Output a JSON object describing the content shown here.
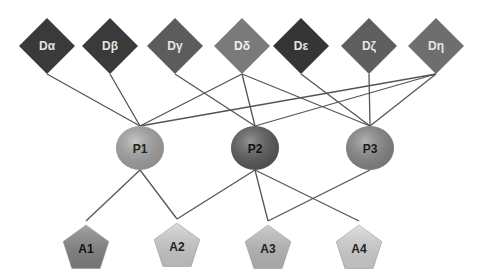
{
  "diagram": {
    "edge_color": "#555555",
    "d_nodes": [
      {
        "id": "Da",
        "label": "Dα",
        "x": 47,
        "y": 46,
        "fill": "#3a3a3a",
        "text": "#e6e6e6"
      },
      {
        "id": "Db",
        "label": "Dβ",
        "x": 110,
        "y": 46,
        "fill": "#3a3a3a",
        "text": "#e6e6e6"
      },
      {
        "id": "Dg",
        "label": "Dγ",
        "x": 175,
        "y": 46,
        "fill": "#5c5c5c",
        "text": "#e6e6e6"
      },
      {
        "id": "Dd",
        "label": "Dδ",
        "x": 242,
        "y": 46,
        "fill": "#7a7a7a",
        "text": "#f0f0f0"
      },
      {
        "id": "De",
        "label": "Dε",
        "x": 301,
        "y": 46,
        "fill": "#353535",
        "text": "#e6e6e6"
      },
      {
        "id": "Dz",
        "label": "Dζ",
        "x": 369,
        "y": 46,
        "fill": "#5e5e5e",
        "text": "#e6e6e6"
      },
      {
        "id": "Dh",
        "label": "Dη",
        "x": 436,
        "y": 46,
        "fill": "#6e6e6e",
        "text": "#e6e6e6"
      }
    ],
    "p_nodes": [
      {
        "id": "P1",
        "label": "P1",
        "x": 140,
        "y": 148,
        "fill": "#a8a8a8",
        "text": "#222222"
      },
      {
        "id": "P2",
        "label": "P2",
        "x": 255,
        "y": 148,
        "fill": "#5a5a5a",
        "text": "#111111"
      },
      {
        "id": "P3",
        "label": "P3",
        "x": 370,
        "y": 148,
        "fill": "#8a8a8a",
        "text": "#1a1a1a"
      }
    ],
    "a_nodes": [
      {
        "id": "A1",
        "label": "A1",
        "x": 86,
        "y": 245,
        "fill": "#858585",
        "text": "#111111"
      },
      {
        "id": "A2",
        "label": "A2",
        "x": 177,
        "y": 243,
        "fill": "#cfcfcf",
        "text": "#222222"
      },
      {
        "id": "A3",
        "label": "A3",
        "x": 268,
        "y": 245,
        "fill": "#bdbdbd",
        "text": "#222222"
      },
      {
        "id": "A4",
        "label": "A4",
        "x": 359,
        "y": 245,
        "fill": "#d6d6d6",
        "text": "#222222"
      }
    ],
    "edges": [
      [
        "Da",
        "P1"
      ],
      [
        "Db",
        "P1"
      ],
      [
        "Dd",
        "P1"
      ],
      [
        "Dh",
        "P1"
      ],
      [
        "Dg",
        "P2"
      ],
      [
        "Dd",
        "P2"
      ],
      [
        "Dh",
        "P2"
      ],
      [
        "Dd",
        "P3"
      ],
      [
        "De",
        "P3"
      ],
      [
        "Dz",
        "P3"
      ],
      [
        "Dh",
        "P3"
      ],
      [
        "P1",
        "A1"
      ],
      [
        "P1",
        "A2"
      ],
      [
        "P2",
        "A2"
      ],
      [
        "P2",
        "A3"
      ],
      [
        "P2",
        "A4"
      ],
      [
        "P3",
        "A3"
      ]
    ]
  }
}
